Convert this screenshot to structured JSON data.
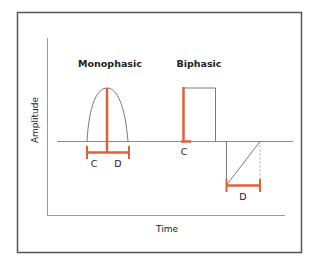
{
  "diagram": {
    "titles": {
      "monophasic": "Monophasic",
      "biphasic": "Biphasic"
    },
    "axes": {
      "y_label": "Amplitude",
      "x_label": "Time"
    },
    "monophasic": {
      "label_left": "C",
      "label_right": "D"
    },
    "biphasic": {
      "label_positive": "C",
      "label_negative": "D"
    },
    "colors": {
      "accent": "#E0603A",
      "frame": "#555555",
      "axis": "#9a9a9a",
      "waveform": "#7a7a7a",
      "text": "#222222"
    }
  }
}
